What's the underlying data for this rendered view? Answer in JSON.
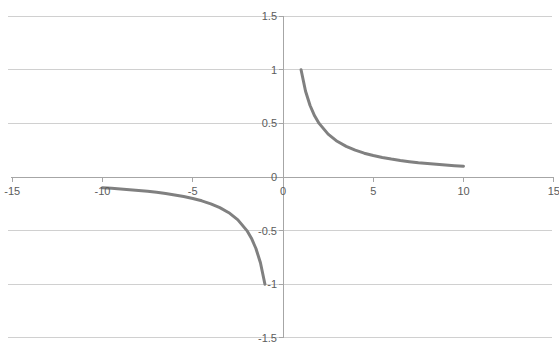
{
  "chart_data": {
    "type": "line",
    "title": "",
    "xlabel": "",
    "ylabel": "",
    "xlim": [
      -15,
      15
    ],
    "ylim": [
      -1.5,
      1.5
    ],
    "xticks": [
      -15,
      -10,
      -5,
      0,
      5,
      10,
      15
    ],
    "xtick_labels": [
      "-15",
      "-10",
      "-5",
      "0",
      "5",
      "10",
      "15"
    ],
    "yticks": [
      1.5,
      1,
      0.5,
      0,
      -0.5,
      -1,
      -1.5
    ],
    "ytick_labels": [
      "1.5",
      "1",
      "0.5",
      "0",
      "-0.5",
      "-1",
      "-1.5"
    ],
    "grid": true,
    "grid_color": "#d0d0d0",
    "axis_color": "#a6a6a6",
    "legend": false,
    "legend_position": "none",
    "series": [
      {
        "name": "y = 1/x (negative branch)",
        "color": "#808080",
        "line_width": 3,
        "x": [
          -10,
          -9.5,
          -9,
          -8.5,
          -8,
          -7.5,
          -7,
          -6.5,
          -6,
          -5.5,
          -5,
          -4.5,
          -4,
          -3.5,
          -3,
          -2.5,
          -2,
          -1.75,
          -1.5,
          -1.25,
          -1
        ],
        "y": [
          -0.1,
          -0.105,
          -0.111,
          -0.118,
          -0.125,
          -0.133,
          -0.143,
          -0.154,
          -0.167,
          -0.182,
          -0.2,
          -0.222,
          -0.25,
          -0.286,
          -0.333,
          -0.4,
          -0.5,
          -0.571,
          -0.667,
          -0.8,
          -1
        ]
      },
      {
        "name": "y = 1/x (positive branch)",
        "color": "#808080",
        "line_width": 3,
        "x": [
          1,
          1.25,
          1.5,
          1.75,
          2,
          2.5,
          3,
          3.5,
          4,
          4.5,
          5,
          5.5,
          6,
          6.5,
          7,
          7.5,
          8,
          8.5,
          9,
          9.5,
          10
        ],
        "y": [
          1,
          0.8,
          0.667,
          0.571,
          0.5,
          0.4,
          0.333,
          0.286,
          0.25,
          0.222,
          0.2,
          0.182,
          0.167,
          0.154,
          0.143,
          0.133,
          0.125,
          0.118,
          0.111,
          0.105,
          0.1
        ]
      }
    ]
  },
  "header": {
    "truncated_text": ""
  },
  "colors": {
    "curve": "#808080",
    "grid": "#d0d0d0",
    "axis": "#a6a6a6",
    "tick_text": "#5c5c5c",
    "background": "#ffffff"
  }
}
